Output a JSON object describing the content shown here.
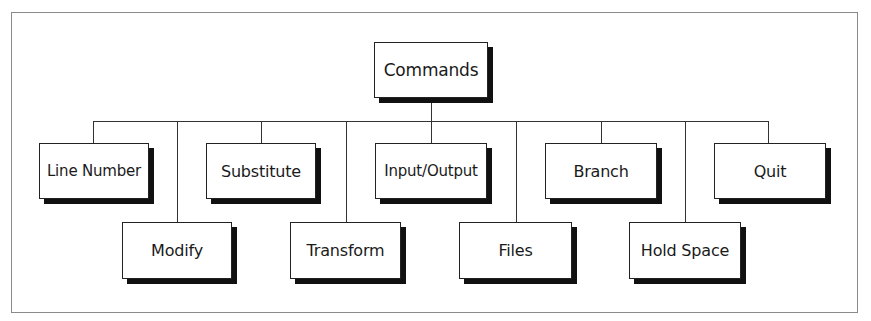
{
  "diagram": {
    "type": "hierarchy",
    "root": {
      "label": "Commands"
    },
    "children": [
      {
        "label": "Line Number",
        "row": 1
      },
      {
        "label": "Modify",
        "row": 2
      },
      {
        "label": "Substitute",
        "row": 1
      },
      {
        "label": "Transform",
        "row": 2
      },
      {
        "label": "Input/Output",
        "row": 1
      },
      {
        "label": "Files",
        "row": 2
      },
      {
        "label": "Branch",
        "row": 1
      },
      {
        "label": "Hold Space",
        "row": 2
      },
      {
        "label": "Quit",
        "row": 1
      }
    ]
  }
}
